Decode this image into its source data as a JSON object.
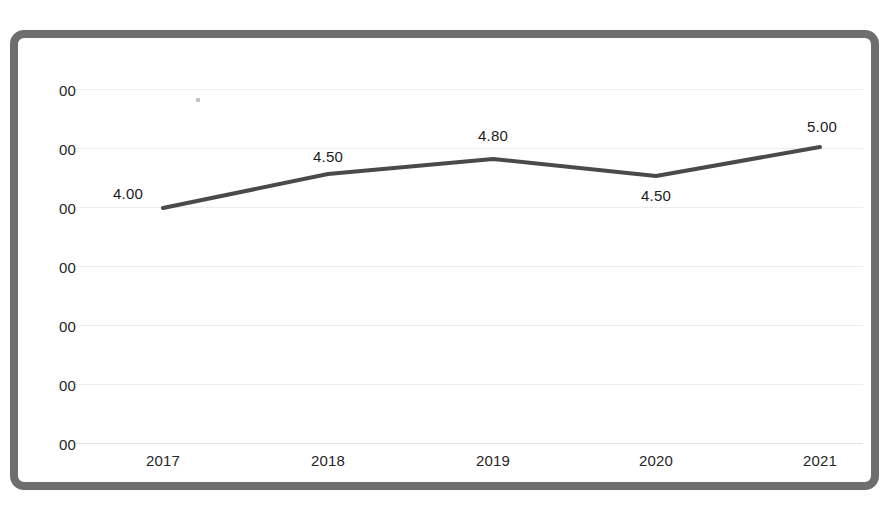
{
  "page": {
    "background_color": "#ffffff",
    "top_cut_text": "—— ——— —— —— ——— —— — ——— ————"
  },
  "frame": {
    "border_color": "#6e6e6e",
    "corner_radius": "14px",
    "fill_color": "#ffffff"
  },
  "chart_data": {
    "type": "line",
    "title": "",
    "subtitle": "",
    "xlabel": "",
    "ylabel": "",
    "categories": [
      "2017",
      "2018",
      "2019",
      "2020",
      "2021"
    ],
    "values": [
      4.0,
      4.5,
      4.8,
      4.5,
      5.0
    ],
    "data_labels": [
      "4.00",
      "4.50",
      "4.80",
      "4.50",
      "5.00"
    ],
    "data_label_positions": [
      "above-left",
      "above",
      "above",
      "below",
      "above"
    ],
    "series": [
      {
        "name": "",
        "values": [
          4.0,
          4.5,
          4.8,
          4.5,
          5.0
        ],
        "color": "#4a4a4a",
        "line_width": 4,
        "markers": false
      }
    ],
    "ytick_labels": [
      "00",
      "00",
      "00",
      "00",
      "00",
      "00",
      "00"
    ],
    "ytick_labels_note": "y-axis tick labels are clipped by the left edge of the capture; only the trailing '00' of each value is rendered",
    "ytick_count": 7,
    "grid": true,
    "grid_color": "#ededed",
    "axis_line_color": "#e3e3e3",
    "legend": false,
    "legend_position": "none",
    "text_color": "#262626"
  },
  "geometry": {
    "ytick_y": [
      51,
      110,
      169,
      228,
      287,
      346,
      405
    ],
    "point_x": [
      145,
      310,
      475,
      638,
      802
    ],
    "point_y": [
      170,
      136,
      121,
      138,
      109
    ],
    "xtick_center_x": [
      145,
      310,
      475,
      638,
      802
    ]
  }
}
